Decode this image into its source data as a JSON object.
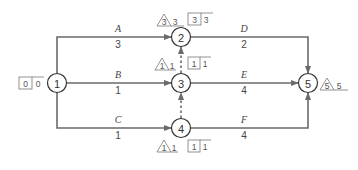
{
  "diagram": {
    "type": "activity-on-arrow network",
    "nodes": [
      {
        "id": "1",
        "label": "1",
        "es": "0",
        "ls": "0"
      },
      {
        "id": "2",
        "label": "2",
        "tri": "3",
        "tri_val": "3",
        "box": "3",
        "box_val": "3"
      },
      {
        "id": "3",
        "label": "3",
        "tri": "1",
        "tri_val": "1",
        "box": "1",
        "box_val": "1"
      },
      {
        "id": "4",
        "label": "4",
        "tri": "1",
        "tri_val": "1",
        "box": "1",
        "box_val": "1"
      },
      {
        "id": "5",
        "label": "5",
        "tri": "5",
        "tri_val": "5"
      }
    ],
    "activities": [
      {
        "name": "A",
        "duration": "3",
        "from": "1",
        "to": "2"
      },
      {
        "name": "B",
        "duration": "1",
        "from": "1",
        "to": "3"
      },
      {
        "name": "C",
        "duration": "1",
        "from": "1",
        "to": "4"
      },
      {
        "name": "D",
        "duration": "2",
        "from": "2",
        "to": "5"
      },
      {
        "name": "E",
        "duration": "4",
        "from": "3",
        "to": "5"
      },
      {
        "name": "F",
        "duration": "4",
        "from": "4",
        "to": "5"
      }
    ],
    "dummies": [
      {
        "from": "3",
        "to": "2"
      },
      {
        "from": "4",
        "to": "3"
      }
    ]
  }
}
